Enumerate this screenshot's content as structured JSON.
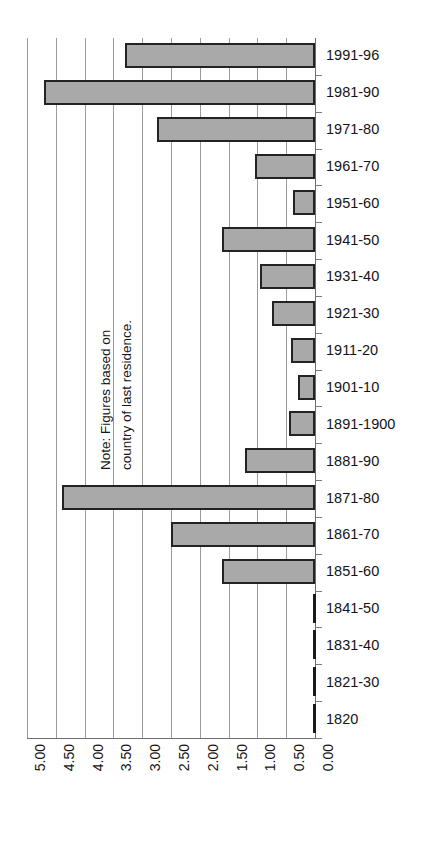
{
  "chart_data": {
    "type": "bar",
    "orientation": "horizontal",
    "title": "",
    "xlabel": "",
    "ylabel": "",
    "xlim": [
      5.0,
      0.0
    ],
    "x_axis_reversed": true,
    "grid": true,
    "legend": null,
    "note": {
      "line1": "Note: Figures based on",
      "line2": "country of last residence."
    },
    "xticks": [
      "5.00",
      "4.50",
      "4.00",
      "3.50",
      "3.00",
      "2.50",
      "2.00",
      "1.50",
      "1.00",
      "0.50",
      "0.00"
    ],
    "xtick_values": [
      5.0,
      4.5,
      4.0,
      3.5,
      3.0,
      2.5,
      2.0,
      1.5,
      1.0,
      0.5,
      0.0
    ],
    "categories": [
      "1991-96",
      "1981-90",
      "1971-80",
      "1961-70",
      "1951-60",
      "1941-50",
      "1931-40",
      "1921-30",
      "1911-20",
      "1901-10",
      "1891-1900",
      "1881-90",
      "1871-80",
      "1861-70",
      "1851-60",
      "1841-50",
      "1831-40",
      "1821-30",
      "1820"
    ],
    "values": [
      3.3,
      4.7,
      2.75,
      1.05,
      0.38,
      1.62,
      0.96,
      0.75,
      0.42,
      0.3,
      0.45,
      1.21,
      4.4,
      2.5,
      1.62,
      0.0,
      0.0,
      0.0,
      0.0
    ],
    "colors": {
      "bar_fill": "#a9a9a9",
      "bar_stroke": "#232323",
      "gridline": "#9a9a9a",
      "axis": "#6e6e6e",
      "text": "#141414",
      "background": "#ffffff"
    }
  }
}
